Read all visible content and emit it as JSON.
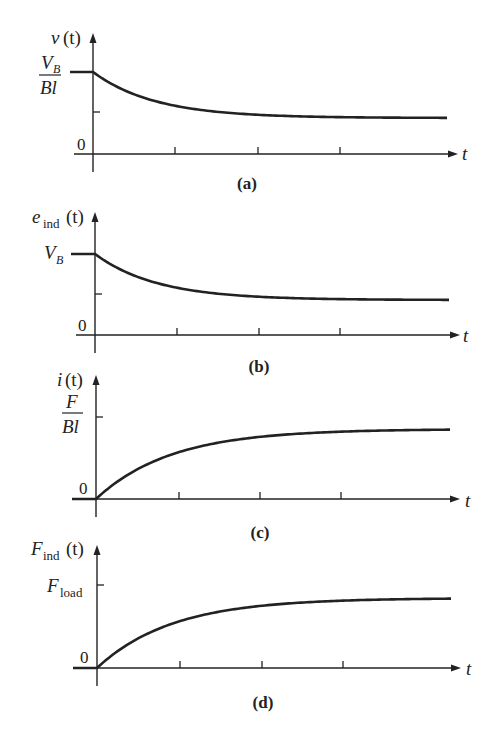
{
  "chart_data": [
    {
      "type": "line",
      "panel": "(a)",
      "caption": "(a)",
      "ylabel": "v (t)",
      "xlabel": "t",
      "y_ticks": [
        {
          "label": "V_B / Bl",
          "value": 1.0
        },
        {
          "label": "0",
          "value": 0
        }
      ],
      "description": "Velocity starts at V_B/Bl and decays exponentially to a lower steady-state value",
      "x": [
        -1,
        0,
        1,
        2,
        3,
        4,
        5
      ],
      "values": [
        1.0,
        1.0,
        0.75,
        0.62,
        0.57,
        0.55,
        0.55
      ],
      "geom": {
        "axisX": 93,
        "axisY": 154,
        "topY": 33,
        "xStart": 74,
        "xEnd": 458,
        "lineStart": 70,
        "lineEnd": 449,
        "y0": 72,
        "yF": 118,
        "tickY": 112,
        "xTicks": [
          175,
          258,
          340
        ],
        "tau": 62,
        "shape": "decay"
      }
    },
    {
      "type": "line",
      "panel": "(b)",
      "caption": "(b)",
      "ylabel": "e_ind (t)",
      "xlabel": "t",
      "y_ticks": [
        {
          "label": "V_B",
          "value": 1.0
        },
        {
          "label": "0",
          "value": 0
        }
      ],
      "description": "Induced voltage starts at V_B and decays exponentially to a lower steady-state value",
      "x": [
        -1,
        0,
        1,
        2,
        3,
        4,
        5
      ],
      "values": [
        1.0,
        1.0,
        0.75,
        0.62,
        0.57,
        0.55,
        0.55
      ],
      "geom": {
        "axisX": 95,
        "axisY": 335,
        "topY": 212,
        "xStart": 76,
        "xEnd": 460,
        "lineStart": 71,
        "lineEnd": 450,
        "y0": 254,
        "yF": 300,
        "tickY": 294,
        "xTicks": [
          177,
          259,
          340
        ],
        "tau": 62,
        "shape": "decay"
      }
    },
    {
      "type": "line",
      "panel": "(c)",
      "caption": "(c)",
      "ylabel": "i (t)",
      "xlabel": "t",
      "y_ticks": [
        {
          "label": "F / Bl",
          "value": 1.0
        },
        {
          "label": "0",
          "value": 0
        }
      ],
      "description": "Current rises from 0 exponentially toward a steady-state value just below F/Bl",
      "x": [
        -1,
        0,
        1,
        2,
        3,
        4,
        5
      ],
      "values": [
        0,
        0,
        0.55,
        0.78,
        0.86,
        0.88,
        0.88
      ],
      "geom": {
        "axisX": 96,
        "axisY": 499,
        "topY": 375,
        "xStart": 78,
        "xEnd": 460,
        "lineStart": 72,
        "lineEnd": 451,
        "y0": 499,
        "yF": 429,
        "tickY": 417,
        "xTicks": [
          179,
          260,
          341
        ],
        "tau": 75,
        "shape": "rise"
      }
    },
    {
      "type": "line",
      "panel": "(d)",
      "caption": "(d)",
      "ylabel": "F_ind (t)",
      "xlabel": "t",
      "y_ticks": [
        {
          "label": "F_load",
          "value": 1.0
        },
        {
          "label": "0",
          "value": 0
        }
      ],
      "description": "Induced force rises from 0 exponentially toward a steady-state value just below F_load",
      "x": [
        -1,
        0,
        1,
        2,
        3,
        4,
        5
      ],
      "values": [
        0,
        0,
        0.55,
        0.78,
        0.86,
        0.88,
        0.88
      ],
      "geom": {
        "axisX": 97,
        "axisY": 668,
        "topY": 545,
        "xStart": 79,
        "xEnd": 461,
        "lineStart": 73,
        "lineEnd": 452,
        "y0": 668,
        "yF": 598,
        "tickY": 585,
        "xTicks": [
          180,
          262,
          343
        ],
        "tau": 75,
        "shape": "rise"
      }
    }
  ],
  "labels": {
    "a": {
      "ylabel_main": "v",
      "ylabel_arg": "(t)",
      "tick_num": "V",
      "tick_num_sub": "B",
      "tick_den": "Bl",
      "zero": "0",
      "t": "t",
      "caption": "(a)"
    },
    "b": {
      "ylabel_main": "e",
      "ylabel_sub": "ind",
      "ylabel_arg": "(t)",
      "tick_main": "V",
      "tick_sub": "B",
      "zero": "0",
      "t": "t",
      "caption": "(b)"
    },
    "c": {
      "ylabel_main": "i",
      "ylabel_arg": "(t)",
      "tick_num": "F",
      "tick_den": "Bl",
      "zero": "0",
      "t": "t",
      "caption": "(c)"
    },
    "d": {
      "ylabel_main": "F",
      "ylabel_sub": "ind",
      "ylabel_arg": "(t)",
      "tick_main": "F",
      "tick_sub": "load",
      "zero": "0",
      "t": "t",
      "caption": "(d)"
    }
  },
  "colors": {
    "ink": "#222222",
    "background": "#ffffff"
  }
}
